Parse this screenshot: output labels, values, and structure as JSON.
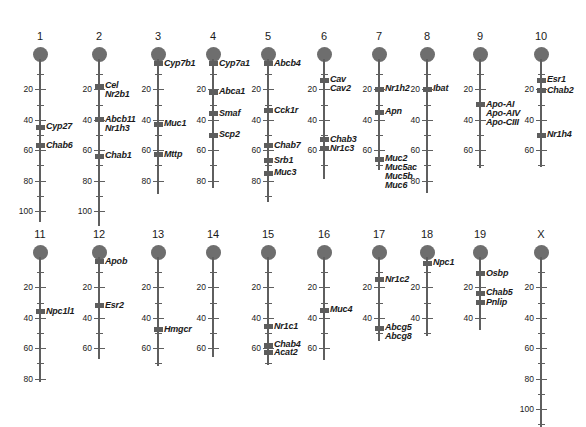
{
  "figure": {
    "type": "chromosome-ideogram",
    "units": "cM",
    "scale_px_per_unit": 1.52,
    "tick_interval_major": 20,
    "tick_interval_minor": 10
  },
  "chart_data": {
    "type": "scatter",
    "title": "",
    "xlabel": "",
    "ylabel": "",
    "axis_units": "cM",
    "tick_labels_major": [
      20,
      40,
      60,
      80,
      100
    ],
    "chromosomes": [
      {
        "name": "1",
        "x": 40,
        "top": 30,
        "length": 107,
        "major_ticks": [
          20,
          40,
          60,
          80,
          100
        ],
        "minor_ticks": [
          10,
          30,
          50,
          70,
          90,
          100
        ],
        "markers": [
          {
            "pos": 45,
            "genes": [
              "Cyp27"
            ]
          },
          {
            "pos": 57,
            "genes": [
              "Chab6"
            ]
          }
        ]
      },
      {
        "name": "2",
        "x": 99,
        "top": 30,
        "length": 110,
        "major_ticks": [
          20,
          40,
          60,
          80,
          100
        ],
        "minor_ticks": [
          10,
          30,
          50,
          70,
          90
        ],
        "markers": [
          {
            "pos": 18,
            "genes": [
              "Cel",
              "Nr2b1"
            ]
          },
          {
            "pos": 40,
            "genes": [
              "Abcb11",
              "Nr1h3"
            ]
          },
          {
            "pos": 64,
            "genes": [
              "Chab1"
            ]
          }
        ]
      },
      {
        "name": "3",
        "x": 158,
        "top": 30,
        "length": 89,
        "major_ticks": [
          20,
          40,
          60,
          80
        ],
        "minor_ticks": [
          10,
          30,
          50,
          70
        ],
        "markers": [
          {
            "pos": 3,
            "genes": [
              "Cyp7b1"
            ]
          },
          {
            "pos": 43,
            "genes": [
              "Muc1"
            ]
          },
          {
            "pos": 63,
            "genes": [
              "Mttp"
            ]
          }
        ]
      },
      {
        "name": "4",
        "x": 213,
        "top": 30,
        "length": 85,
        "major_ticks": [
          20,
          40,
          60,
          80
        ],
        "minor_ticks": [
          10,
          30,
          50,
          70
        ],
        "markers": [
          {
            "pos": 3,
            "genes": [
              "Cyp7a1"
            ]
          },
          {
            "pos": 22,
            "genes": [
              "Abca1"
            ]
          },
          {
            "pos": 36,
            "genes": [
              "Smaf"
            ]
          },
          {
            "pos": 50,
            "genes": [
              "Scp2"
            ]
          }
        ]
      },
      {
        "name": "5",
        "x": 268,
        "top": 30,
        "length": 94,
        "major_ticks": [
          20,
          40,
          60,
          80
        ],
        "minor_ticks": [
          10,
          30,
          50,
          70,
          90
        ],
        "markers": [
          {
            "pos": 3,
            "genes": [
              "Abcb4"
            ]
          },
          {
            "pos": 34,
            "genes": [
              "Cck1r"
            ]
          },
          {
            "pos": 57,
            "genes": [
              "Chab7"
            ]
          },
          {
            "pos": 67,
            "genes": [
              "Srb1"
            ]
          },
          {
            "pos": 75,
            "genes": [
              "Muc3"
            ]
          }
        ]
      },
      {
        "name": "6",
        "x": 324,
        "top": 30,
        "length": 79,
        "major_ticks": [
          20,
          40,
          60
        ],
        "minor_ticks": [
          10,
          30,
          50,
          70
        ],
        "markers": [
          {
            "pos": 14,
            "genes": [
              "Cav",
              "Cav2"
            ]
          },
          {
            "pos": 53,
            "genes": [
              "Chab3"
            ]
          },
          {
            "pos": 59,
            "genes": [
              "Nr1c3"
            ]
          }
        ]
      },
      {
        "name": "7",
        "x": 379,
        "top": 30,
        "length": 73,
        "major_ticks": [
          20,
          40,
          60
        ],
        "minor_ticks": [
          10,
          30,
          50,
          70
        ],
        "markers": [
          {
            "pos": 20,
            "genes": [
              "Nr1h2"
            ]
          },
          {
            "pos": 35,
            "genes": [
              "Apn"
            ]
          },
          {
            "pos": 66,
            "genes": [
              "Muc2",
              "Muc5ac",
              "Muc5b",
              "Muc6"
            ]
          }
        ]
      },
      {
        "name": "8",
        "x": 427,
        "top": 30,
        "length": 88,
        "major_ticks": [
          20,
          40,
          60,
          80
        ],
        "minor_ticks": [
          10,
          30,
          50,
          70
        ],
        "markers": [
          {
            "pos": 20,
            "genes": [
              "Ibat"
            ]
          }
        ]
      },
      {
        "name": "9",
        "x": 480,
        "top": 30,
        "length": 72,
        "major_ticks": [
          20,
          40,
          60
        ],
        "minor_ticks": [
          10,
          30,
          50,
          70
        ],
        "markers": [
          {
            "pos": 30,
            "genes": [
              "Apo-AI",
              "Apo-AIV",
              "Apo-CIII"
            ]
          }
        ]
      },
      {
        "name": "10",
        "x": 541,
        "top": 30,
        "length": 71,
        "major_ticks": [
          20,
          40,
          60
        ],
        "minor_ticks": [
          10,
          30,
          50,
          70
        ],
        "markers": [
          {
            "pos": 14,
            "genes": [
              "Esr1"
            ]
          },
          {
            "pos": 21,
            "genes": [
              "Chab2"
            ]
          },
          {
            "pos": 50,
            "genes": [
              "Nr1h4"
            ]
          }
        ]
      },
      {
        "name": "11",
        "x": 40,
        "top": 228,
        "length": 82,
        "major_ticks": [
          20,
          40,
          60,
          80
        ],
        "minor_ticks": [
          10,
          30,
          50,
          70
        ],
        "markers": [
          {
            "pos": 36,
            "genes": [
              "Npc1l1"
            ]
          }
        ]
      },
      {
        "name": "12",
        "x": 99,
        "top": 228,
        "length": 67,
        "major_ticks": [
          20,
          40,
          60
        ],
        "minor_ticks": [
          10,
          30,
          50
        ],
        "markers": [
          {
            "pos": 3,
            "genes": [
              "Apob"
            ]
          },
          {
            "pos": 32,
            "genes": [
              "Esr2"
            ]
          }
        ]
      },
      {
        "name": "13",
        "x": 158,
        "top": 228,
        "length": 72,
        "major_ticks": [
          20,
          40,
          60
        ],
        "minor_ticks": [
          10,
          30,
          50,
          70
        ],
        "markers": [
          {
            "pos": 48,
            "genes": [
              "Hmgcr"
            ]
          }
        ]
      },
      {
        "name": "14",
        "x": 213,
        "top": 228,
        "length": 66,
        "major_ticks": [
          20,
          40,
          60
        ],
        "minor_ticks": [
          10,
          30,
          50
        ],
        "markers": []
      },
      {
        "name": "15",
        "x": 268,
        "top": 228,
        "length": 71,
        "major_ticks": [
          20,
          40,
          60
        ],
        "minor_ticks": [
          10,
          30,
          50,
          70
        ],
        "markers": [
          {
            "pos": 46,
            "genes": [
              "Nr1c1"
            ]
          },
          {
            "pos": 58,
            "genes": [
              "Chab4"
            ]
          },
          {
            "pos": 63,
            "genes": [
              "Acat2"
            ]
          }
        ]
      },
      {
        "name": "16",
        "x": 324,
        "top": 228,
        "length": 68,
        "major_ticks": [
          20,
          40,
          60
        ],
        "minor_ticks": [
          10,
          30,
          50
        ],
        "markers": [
          {
            "pos": 35,
            "genes": [
              "Muc4"
            ]
          }
        ]
      },
      {
        "name": "17",
        "x": 379,
        "top": 228,
        "length": 55,
        "major_ticks": [
          20,
          40
        ],
        "minor_ticks": [
          10,
          30,
          50
        ],
        "markers": [
          {
            "pos": 15,
            "genes": [
              "Nr1c2"
            ]
          },
          {
            "pos": 47,
            "genes": [
              "Abcg5",
              "Abcg8"
            ]
          }
        ]
      },
      {
        "name": "18",
        "x": 427,
        "top": 228,
        "length": 52,
        "major_ticks": [
          20,
          40
        ],
        "minor_ticks": [
          10,
          30,
          50
        ],
        "markers": [
          {
            "pos": 4,
            "genes": [
              "Npc1"
            ]
          }
        ]
      },
      {
        "name": "19",
        "x": 480,
        "top": 228,
        "length": 48,
        "major_ticks": [
          20,
          40
        ],
        "minor_ticks": [
          10,
          30
        ],
        "markers": [
          {
            "pos": 11,
            "genes": [
              "Osbp"
            ]
          },
          {
            "pos": 24,
            "genes": [
              "Chab5"
            ]
          },
          {
            "pos": 30,
            "genes": [
              "Pnlip"
            ]
          }
        ]
      },
      {
        "name": "X",
        "x": 541,
        "top": 228,
        "length": 112,
        "major_ticks": [
          20,
          40,
          60,
          80,
          100
        ],
        "minor_ticks": [
          10,
          30,
          50,
          70,
          90,
          110
        ],
        "markers": []
      }
    ]
  },
  "colors": {
    "centromere": "#6e6e6e",
    "axis": "#5f5f5f",
    "marker": "#5d5d5d",
    "text": "#1a1a1a",
    "background": "#ffffff"
  }
}
